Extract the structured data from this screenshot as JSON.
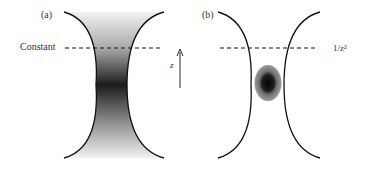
{
  "figure": {
    "panel_a": {
      "label": "(a)",
      "line_label": "Constant",
      "axis_label": "z",
      "description": "Beam waist profile with gradient intensity, darkest at the focus"
    },
    "panel_b": {
      "label": "(b)",
      "line_label": "1/z²",
      "description": "Beam waist profile with localized dark spot at the focus"
    },
    "colors": {
      "curve": "#111111",
      "gradient_dark": "#1a1a1a",
      "gradient_light": "#f0f0f0",
      "blob_outer": "#8a8a8a",
      "blob_inner": "#0a0a0a"
    }
  }
}
